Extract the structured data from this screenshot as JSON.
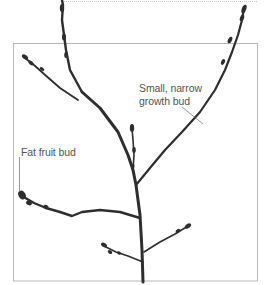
{
  "diagram": {
    "title": "",
    "labels": {
      "growth_bud": {
        "line1": "Small, narrow",
        "line2": "growth bud"
      },
      "fruit_bud": "Fat fruit bud"
    },
    "colors": {
      "branch": "#2e2e2e",
      "frame": "#b8b8b8",
      "leader": "#6a6a6a",
      "text": "#555555",
      "dotted_rule": "#c8c8c8"
    }
  }
}
